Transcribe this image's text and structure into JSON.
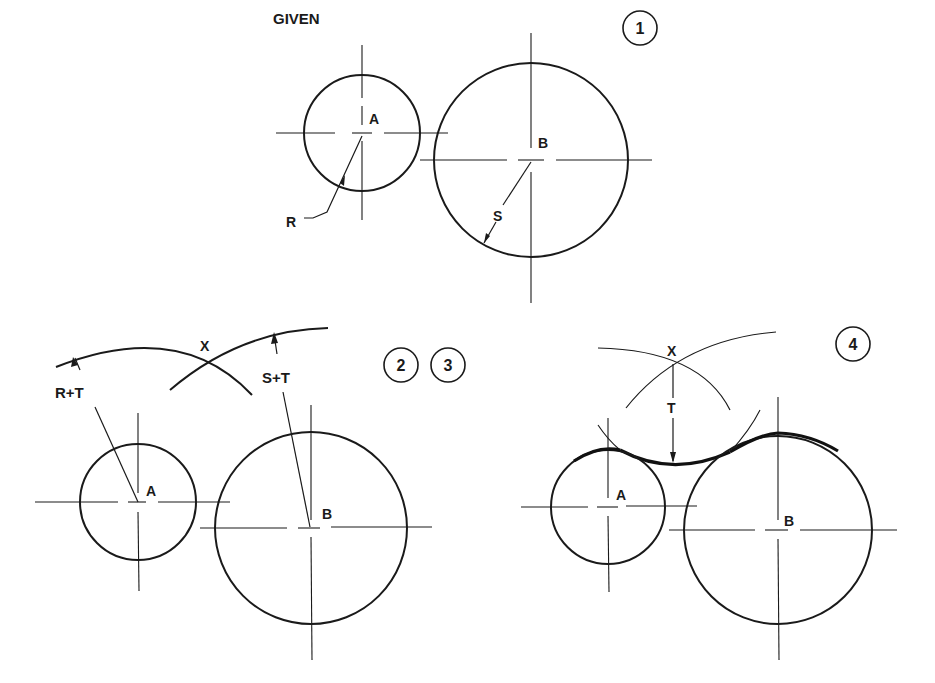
{
  "title": "GIVEN",
  "steps": {
    "step1": "1",
    "step2": "2",
    "step3": "3",
    "step4": "4"
  },
  "labels": {
    "center_a": "A",
    "center_b": "B",
    "radius_r": "R",
    "radius_s": "S",
    "arc_r_plus_t": "R+T",
    "arc_s_plus_t": "S+T",
    "intersection_x": "X",
    "tangent_radius_t": "T"
  },
  "colors": {
    "ink": "#1a1a1a",
    "background": "#ffffff"
  }
}
